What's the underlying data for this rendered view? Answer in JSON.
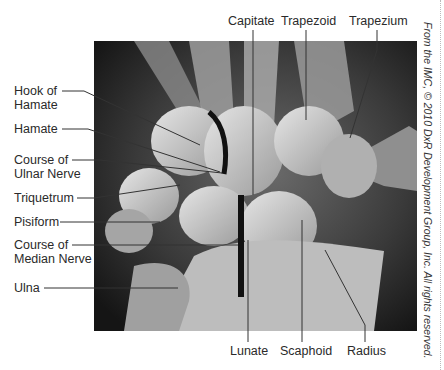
{
  "figure": {
    "copyright": "From the IMC, © 2010 DxR Development Group, Inc. All rights reserved.",
    "watermark": "",
    "labels_top": [
      {
        "id": "capitate",
        "text": "Capitate"
      },
      {
        "id": "trapezoid",
        "text": "Trapezoid"
      },
      {
        "id": "trapezium",
        "text": "Trapezium"
      }
    ],
    "labels_left": [
      {
        "id": "hook-of-hamate",
        "line1": "Hook of",
        "line2": "Hamate"
      },
      {
        "id": "hamate",
        "line1": "Hamate"
      },
      {
        "id": "course-of-ulnar-nerve",
        "line1": "Course of",
        "line2": "Ulnar  Nerve"
      },
      {
        "id": "triquetrum",
        "line1": "Triquetrum"
      },
      {
        "id": "pisiform",
        "line1": "Pisiform"
      },
      {
        "id": "course-of-median-nerve",
        "line1": "Course of",
        "line2": "Median Nerve"
      },
      {
        "id": "ulna",
        "line1": "Ulna"
      }
    ],
    "labels_bottom": [
      {
        "id": "lunate",
        "text": "Lunate"
      },
      {
        "id": "scaphoid",
        "text": "Scaphoid"
      },
      {
        "id": "radius",
        "text": "Radius"
      }
    ],
    "colors": {
      "background": "#ffffff",
      "xray_dark": "#1c1c1c",
      "bone_light": "#cfcfcf",
      "leader_line": "#333333",
      "nerve_marker": "#111111"
    }
  }
}
